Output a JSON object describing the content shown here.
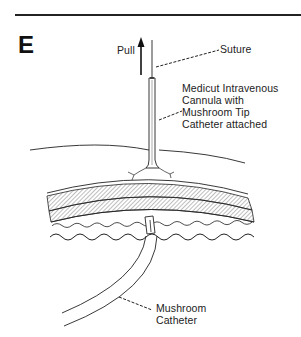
{
  "figure": {
    "panel_letter": "E",
    "labels": {
      "pull": "Pull",
      "suture": "Suture",
      "cannula": [
        "Medicut Intravenous",
        "Cannula with",
        "Mushroom Tip",
        "Catheter attached"
      ],
      "catheter": [
        "Mushroom",
        "Catheter"
      ]
    }
  }
}
